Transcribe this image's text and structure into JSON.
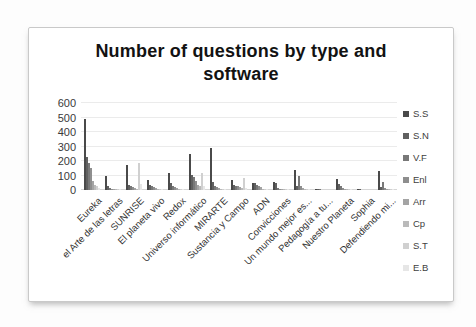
{
  "title": "Number of questions by type and software",
  "chart_data": {
    "type": "bar",
    "title": "Number of questions by type and software",
    "xlabel": "",
    "ylabel": "",
    "ylim": [
      0,
      600
    ],
    "yticks": [
      0,
      100,
      200,
      300,
      400,
      500,
      600
    ],
    "grid": true,
    "legend_position": "right",
    "categories": [
      "Eureka",
      "el Arte de las letras",
      "SUNRISE",
      "El planeta vivo",
      "Redox",
      "Universo informático",
      "MIRARTE",
      "Sustancia y Campo",
      "ADN",
      "Convicciones",
      "Un mundo mejor es...",
      "Pedagogía a tu...",
      "Nuestro Planeta",
      "Sophia",
      "Defendiendo mi..."
    ],
    "series": [
      {
        "name": "S.S",
        "color": "#4a4a4a",
        "values": [
          490,
          100,
          170,
          70,
          120,
          250,
          290,
          70,
          50,
          55,
          140,
          10,
          75,
          5,
          130
        ]
      },
      {
        "name": "S.N",
        "color": "#606060",
        "values": [
          230,
          25,
          35,
          35,
          45,
          105,
          55,
          35,
          45,
          50,
          30,
          5,
          40,
          5,
          20
        ]
      },
      {
        "name": "V.F",
        "color": "#787878",
        "values": [
          185,
          15,
          30,
          25,
          30,
          90,
          30,
          30,
          35,
          15,
          95,
          5,
          25,
          0,
          55
        ]
      },
      {
        "name": "Enl",
        "color": "#8e8e8e",
        "values": [
          150,
          10,
          20,
          20,
          20,
          65,
          20,
          25,
          25,
          10,
          25,
          0,
          15,
          0,
          15
        ]
      },
      {
        "name": "Arr",
        "color": "#a4a4a4",
        "values": [
          60,
          10,
          15,
          15,
          15,
          35,
          15,
          20,
          20,
          10,
          15,
          0,
          10,
          0,
          10
        ]
      },
      {
        "name": "Cp",
        "color": "#bababa",
        "values": [
          35,
          5,
          10,
          10,
          10,
          25,
          10,
          15,
          10,
          5,
          10,
          0,
          10,
          0,
          5
        ]
      },
      {
        "name": "S.T",
        "color": "#d0d0d0",
        "values": [
          25,
          5,
          185,
          10,
          10,
          120,
          10,
          85,
          10,
          5,
          10,
          0,
          5,
          0,
          5
        ]
      },
      {
        "name": "E.B",
        "color": "#e6e6e6",
        "values": [
          15,
          5,
          40,
          5,
          5,
          25,
          5,
          15,
          5,
          5,
          5,
          0,
          5,
          0,
          5
        ]
      }
    ]
  }
}
